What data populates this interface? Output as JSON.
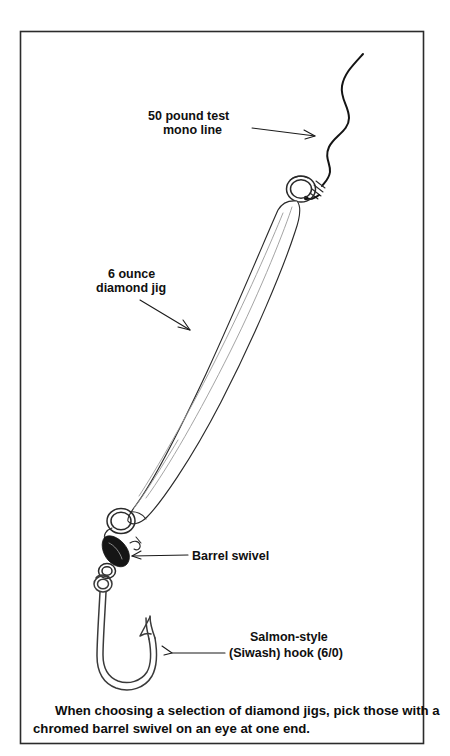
{
  "figure": {
    "background_color": "#ffffff",
    "ink_color": "#1a1a1a",
    "frame": {
      "name": "figure-border",
      "x": 20,
      "y": 31,
      "width": 404,
      "height": 713
    }
  },
  "labels": {
    "mono_line": {
      "line1": "50 pound test",
      "line2": "mono line"
    },
    "diamond_jig": {
      "line1": "6 ounce",
      "line2": "diamond jig"
    },
    "barrel_swivel": {
      "line1": "Barrel swivel"
    },
    "hook": {
      "line1": "Salmon-style",
      "line2": "(Siwash) hook (6/0)"
    }
  },
  "caption": {
    "line1": "When choosing a selection of diamond jigs, pick those with a",
    "line2": "chromed barrel swivel on an eye at one end."
  },
  "parts": [
    {
      "id": "mono-line",
      "name": "monofilament-fishing-line",
      "description": "wavy 50 pound test mono line entering from top right"
    },
    {
      "id": "knot",
      "name": "line-knot",
      "description": "knot wraps securing line to top split ring"
    },
    {
      "id": "top-split-ring",
      "name": "top-split-ring",
      "description": "round split ring at top eye of jig"
    },
    {
      "id": "jig-body",
      "name": "diamond-jig-body",
      "description": "elongated faceted chrome diamond jig, 6 ounce"
    },
    {
      "id": "bottom-split-ring",
      "name": "bottom-split-ring",
      "description": "round split ring at bottom eye of jig"
    },
    {
      "id": "barrel-swivel",
      "name": "barrel-swivel",
      "description": "chromed barrel swivel, drawn dark"
    },
    {
      "id": "hook-eye",
      "name": "hook-eye",
      "description": "ringed eye of the salmon hook"
    },
    {
      "id": "hook",
      "name": "siwash-hook",
      "description": "Salmon-style Siwash hook size 6/0"
    }
  ]
}
